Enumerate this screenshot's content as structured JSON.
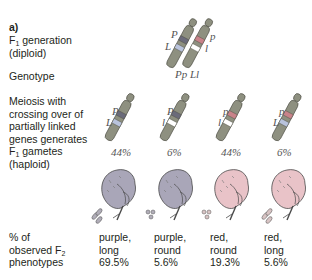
{
  "figure": {
    "panel_label": "a)",
    "rows": {
      "f1_generation": {
        "text": "F",
        "sub": "1",
        "rest": " generation",
        "line2": "(diploid)"
      },
      "genotype": {
        "label": "Genotype",
        "value": "Pp Ll"
      },
      "meiosis": {
        "lines": [
          "Meiosis with",
          "crossing over of",
          "partially linked",
          "genes generates"
        ],
        "line5_pre": "F",
        "line5_sub": "1",
        "line5_post": " gametes",
        "line6": "(haploid)"
      },
      "phenotypes": {
        "line1": "% of",
        "line2_pre": "observed F",
        "line2_sub": "2",
        "line3": "phenotypes"
      }
    },
    "f1_chromosomes": [
      {
        "top_allele": "P",
        "bottom_allele": "L",
        "top_color": "#6b6b7a",
        "bottom_color": "#b9c3dc"
      },
      {
        "top_allele": "p",
        "bottom_allele": "l",
        "top_color": "#c9838a",
        "bottom_color": "#ffffff"
      }
    ],
    "gametes": [
      {
        "top_allele": "P",
        "bottom_allele": "L",
        "top_color": "#6b6b7a",
        "bottom_color": "#b9c3dc",
        "percent": "44%"
      },
      {
        "top_allele": "P",
        "bottom_allele": "l",
        "top_color": "#6b6b7a",
        "bottom_color": "#ffffff",
        "percent": "6%"
      },
      {
        "top_allele": "p",
        "bottom_allele": "l",
        "top_color": "#c9838a",
        "bottom_color": "#ffffff",
        "percent": "44%"
      },
      {
        "top_allele": "p",
        "bottom_allele": "L",
        "top_color": "#c9838a",
        "bottom_color": "#b9c3dc",
        "percent": "6%"
      }
    ],
    "f2_phenotypes": [
      {
        "color_word": "purple,",
        "shape_word": "long",
        "percent": "69.5%",
        "flower_color": "#a9a6b8",
        "pollen": "long"
      },
      {
        "color_word": "purple,",
        "shape_word": "round",
        "percent": "5.6%",
        "flower_color": "#a9a6b8",
        "pollen": "round"
      },
      {
        "color_word": "red,",
        "shape_word": "round",
        "percent": "19.3%",
        "flower_color": "#e9c3c8",
        "pollen": "round"
      },
      {
        "color_word": "red,",
        "shape_word": "long",
        "percent": "5.6%",
        "flower_color": "#e9c3c8",
        "pollen": "long"
      }
    ],
    "colors": {
      "chromosome": "#8e9080",
      "chromosome_outline": "#4a4a40",
      "text": "#231f20",
      "allele_text": "#555555"
    }
  }
}
